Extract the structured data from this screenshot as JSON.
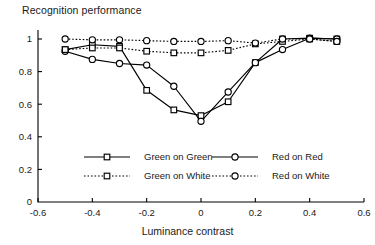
{
  "chart_data": {
    "type": "line",
    "title": "",
    "ylabel": "Recognition performance",
    "xlabel": "Luminance contrast",
    "xlim": [
      -0.6,
      0.6
    ],
    "ylim": [
      0,
      1.05
    ],
    "xticks": [
      -0.6,
      -0.4,
      -0.2,
      0,
      0.2,
      0.4,
      0.6
    ],
    "xtick_labels": [
      "-0.6",
      "-0.4",
      "-0.2",
      "0",
      "0.2",
      "0.4",
      "0.6"
    ],
    "yticks": [
      0,
      0.2,
      0.4,
      0.6,
      0.8,
      1
    ],
    "ytick_labels": [
      "0",
      "0.2",
      "0.4",
      "0.6",
      "0.8",
      "1"
    ],
    "grid": false,
    "legend_position": "lower-center",
    "x": [
      -0.5,
      -0.4,
      -0.3,
      -0.2,
      -0.1,
      0,
      0.1,
      0.2,
      0.3,
      0.4,
      0.5
    ],
    "series": [
      {
        "name": "Green on Green",
        "marker": "square",
        "linestyle": "solid",
        "values": [
          0.935,
          0.965,
          0.955,
          0.685,
          0.565,
          0.53,
          0.615,
          0.855,
          1.0,
          1.005,
          1.0
        ]
      },
      {
        "name": "Red on Red",
        "marker": "circle",
        "linestyle": "solid",
        "values": [
          0.925,
          0.875,
          0.85,
          0.84,
          0.71,
          0.495,
          0.675,
          0.855,
          0.935,
          1.005,
          1.0
        ]
      },
      {
        "name": "Green on White",
        "marker": "square",
        "linestyle": "dotted",
        "values": [
          0.935,
          0.945,
          0.945,
          0.925,
          0.915,
          0.915,
          0.93,
          0.97,
          0.985,
          1.0,
          0.985
        ]
      },
      {
        "name": "Red on White",
        "marker": "circle",
        "linestyle": "dotted",
        "values": [
          1.0,
          0.995,
          0.995,
          0.99,
          0.985,
          0.985,
          0.99,
          0.975,
          1.0,
          1.0,
          0.985
        ]
      }
    ],
    "legend": [
      {
        "label": "Green on Green",
        "marker": "square",
        "linestyle": "solid"
      },
      {
        "label": "Red on Red",
        "marker": "circle",
        "linestyle": "solid"
      },
      {
        "label": "Green on  White",
        "marker": "square",
        "linestyle": "dotted"
      },
      {
        "label": "Red on White",
        "marker": "circle",
        "linestyle": "dotted"
      }
    ]
  }
}
